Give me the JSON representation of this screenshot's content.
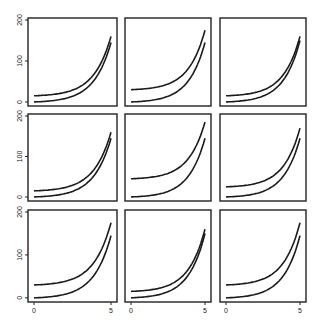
{
  "title": "",
  "chart_data": {
    "type": "line",
    "layout": "3x3 small multiples",
    "xlabel": "",
    "ylabel": "",
    "xlim": [
      0,
      5
    ],
    "ylim": [
      -5,
      200
    ],
    "x_ticks": [
      "0",
      "5"
    ],
    "y_ticks": [
      "0",
      "100",
      "200"
    ],
    "grid": false,
    "legend": null,
    "panels": [
      {
        "row": 1,
        "col": 1,
        "series": [
          {
            "name": "upper",
            "start": 15,
            "end": 160
          },
          {
            "name": "lower",
            "start": 0,
            "end": 145
          }
        ]
      },
      {
        "row": 1,
        "col": 2,
        "series": [
          {
            "name": "upper",
            "start": 30,
            "end": 175
          },
          {
            "name": "lower",
            "start": 0,
            "end": 145
          }
        ]
      },
      {
        "row": 1,
        "col": 3,
        "series": [
          {
            "name": "upper",
            "start": 15,
            "end": 160
          },
          {
            "name": "lower",
            "start": 0,
            "end": 150
          }
        ]
      },
      {
        "row": 2,
        "col": 1,
        "series": [
          {
            "name": "upper",
            "start": 15,
            "end": 160
          },
          {
            "name": "lower",
            "start": 0,
            "end": 145
          }
        ]
      },
      {
        "row": 2,
        "col": 2,
        "series": [
          {
            "name": "upper",
            "start": 45,
            "end": 185
          },
          {
            "name": "lower",
            "start": 0,
            "end": 145
          }
        ]
      },
      {
        "row": 2,
        "col": 3,
        "series": [
          {
            "name": "upper",
            "start": 25,
            "end": 170
          },
          {
            "name": "lower",
            "start": 0,
            "end": 145
          }
        ]
      },
      {
        "row": 3,
        "col": 1,
        "series": [
          {
            "name": "upper",
            "start": 30,
            "end": 175
          },
          {
            "name": "lower",
            "start": 0,
            "end": 145
          }
        ]
      },
      {
        "row": 3,
        "col": 2,
        "series": [
          {
            "name": "upper",
            "start": 15,
            "end": 160
          },
          {
            "name": "lower",
            "start": 0,
            "end": 150
          }
        ]
      },
      {
        "row": 3,
        "col": 3,
        "series": [
          {
            "name": "upper",
            "start": 30,
            "end": 175
          },
          {
            "name": "lower",
            "start": 0,
            "end": 145
          }
        ]
      }
    ]
  }
}
